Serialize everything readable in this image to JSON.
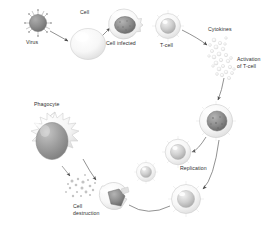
{
  "diagram": {
    "background_color": "#ffffff",
    "label_color": "#2f2f2f",
    "labels": {
      "virus": "Virus",
      "cell": "Cell",
      "cell_infected": "Cell infected",
      "t_cell": "T-cell",
      "cytokines": "Cytokines",
      "activation_line1": "Activation",
      "activation_line2": "of T-cell",
      "replication": "Replication",
      "phagocyte": "Phagocyte",
      "cell_destruction_line1": "Cell",
      "cell_destruction_line2": "destruction"
    },
    "nodes": [
      {
        "id": "virus",
        "name": "virus-particle",
        "label": "Virus",
        "cx": 38,
        "cy": 23,
        "r": 9,
        "fill": "#8d8d8d",
        "spikes": 12
      },
      {
        "id": "cell",
        "name": "healthy-cell",
        "label": "Cell",
        "cx": 88,
        "cy": 42,
        "r": 17,
        "fill": "#f4f4f4"
      },
      {
        "id": "cell_infected",
        "name": "infected-cell",
        "label": "Cell infected",
        "cx": 124,
        "cy": 24,
        "r": 15,
        "fill": "#ededed",
        "nucleus_fill": "#7b7b7b"
      },
      {
        "id": "t_cell",
        "name": "t-cell",
        "label": "T-cell",
        "cx": 168,
        "cy": 26,
        "r": 13,
        "fill": "#efefef",
        "nucleus_fill": "#cfcfcf"
      },
      {
        "id": "cytokines",
        "name": "cytokine-cluster",
        "label": "Cytokines",
        "cx": 222,
        "cy": 58,
        "count": 26,
        "fill": "#dcdcdc"
      },
      {
        "id": "activated_t_cell",
        "name": "activated-t-cell",
        "label": "Activation of T-cell",
        "cx": 216,
        "cy": 121,
        "r": 17,
        "fill": "#ededed",
        "nucleus_fill": "#8a8a8a"
      },
      {
        "id": "replicated_1",
        "name": "replicated-t-cell-upper",
        "cx": 178,
        "cy": 152,
        "r": 13,
        "fill": "#f0f0f0",
        "nucleus_fill": "#c3c3c3"
      },
      {
        "id": "replicated_2",
        "name": "replicated-t-cell-left",
        "cx": 146,
        "cy": 172,
        "r": 10,
        "fill": "#f3f3f3",
        "nucleus_fill": "#cecece"
      },
      {
        "id": "replicated_3",
        "name": "replicated-t-cell-lower",
        "cx": 186,
        "cy": 199,
        "r": 15,
        "fill": "#f0f0f0",
        "nucleus_fill": "#c3c3c3"
      },
      {
        "id": "phagocyte",
        "name": "phagocyte-cell",
        "label": "Phagocyte",
        "cx": 50,
        "cy": 143,
        "r": 26,
        "fill": "#f2f2f2",
        "nucleus_fill": "#9d9d9d"
      },
      {
        "id": "destroyed_cell",
        "name": "destroyed-cell",
        "label": "Cell destruction",
        "cx": 113,
        "cy": 199,
        "r": 15,
        "fill": "#e8e8e8",
        "nucleus_fill": "#8c8c8c"
      }
    ],
    "label_positions": [
      {
        "key": "virus",
        "x": 26,
        "y": 42,
        "name": "label-virus"
      },
      {
        "key": "cell",
        "x": 80,
        "y": 12,
        "name": "label-cell"
      },
      {
        "key": "cell_infected",
        "x": 109,
        "y": 43,
        "name": "label-cell-infected"
      },
      {
        "key": "t_cell",
        "x": 161,
        "y": 44,
        "name": "label-t-cell"
      },
      {
        "key": "cytokines",
        "x": 209,
        "y": 28,
        "name": "label-cytokines"
      },
      {
        "key": "activation_line1",
        "x": 240,
        "y": 59,
        "name": "label-activation-line1"
      },
      {
        "key": "activation_line2",
        "x": 240,
        "y": 66,
        "name": "label-activation-line2"
      },
      {
        "key": "replication",
        "x": 180,
        "y": 166,
        "name": "label-replication"
      },
      {
        "key": "phagocyte",
        "x": 35,
        "y": 103,
        "name": "label-phagocyte"
      },
      {
        "key": "cell_destruction_line1",
        "x": 73,
        "y": 206,
        "name": "label-cell-destruction-line1"
      },
      {
        "key": "cell_destruction_line2",
        "x": 73,
        "y": 213,
        "name": "label-cell-destruction-line2"
      }
    ],
    "connectors": [
      {
        "name": "arrow-virus-to-cell",
        "from": "virus",
        "to": "cell"
      },
      {
        "name": "arrow-cell-to-infected",
        "from": "cell",
        "to": "cell_infected"
      },
      {
        "name": "arrow-tcell-to-cytokines",
        "from": "t_cell",
        "to": "cytokines"
      },
      {
        "name": "arrow-cytokines-to-activation",
        "from": "cytokines",
        "to": "activated_t_cell"
      },
      {
        "name": "arrow-activated-to-replication-upper",
        "from": "activated_t_cell",
        "to": "replicated_1"
      },
      {
        "name": "arrow-activated-to-replication-lower",
        "from": "activated_t_cell",
        "to": "replicated_3"
      },
      {
        "name": "line-replication-to-destruction",
        "from": "replicated_3",
        "to": "destroyed_cell"
      },
      {
        "name": "arrow-phagocyte-to-destruction",
        "from": "phagocyte",
        "to": "destroyed_cell"
      }
    ]
  }
}
